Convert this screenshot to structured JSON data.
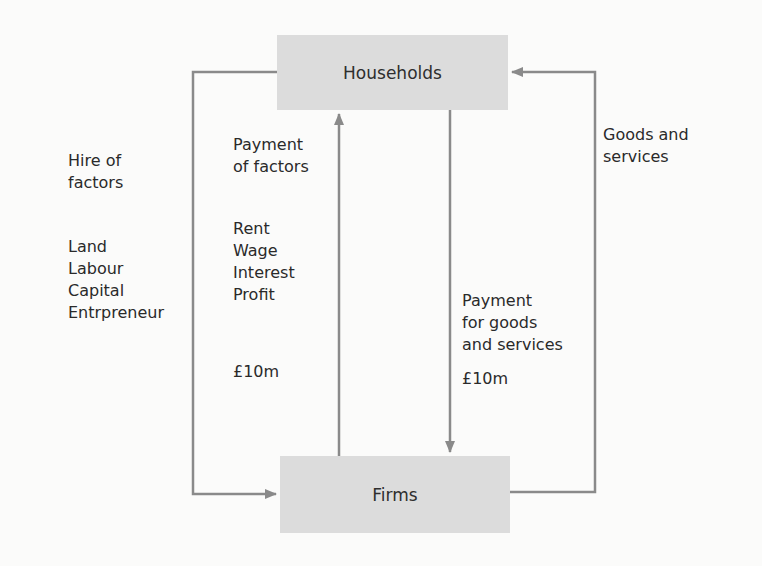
{
  "nodes": {
    "households": "Households",
    "firms": "Firms"
  },
  "labels": {
    "hire_of_factors": [
      "Hire of",
      "factors"
    ],
    "factors": [
      "Land",
      "Labour",
      "Capital",
      "Entrpreneur"
    ],
    "payment_of_factors": [
      "Payment",
      "of factors"
    ],
    "factor_payments": [
      "Rent",
      "Wage",
      "Interest",
      "Profit"
    ],
    "factor_amount": "£10m",
    "goods_and_services": [
      "Goods and",
      "services"
    ],
    "payment_for_goods": [
      "Payment",
      "for goods",
      "and services"
    ],
    "goods_amount": "£10m"
  },
  "colors": {
    "box_fill": "#dcdcdc",
    "line": "#8a8a8a",
    "text": "#2a2a2a"
  }
}
